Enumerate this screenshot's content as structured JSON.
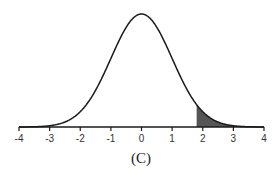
{
  "chart_data": {
    "type": "area",
    "title": "",
    "caption": "(C)",
    "xlabel": "",
    "ylabel": "",
    "xlim": [
      -4,
      4
    ],
    "x_ticks": [
      -4,
      -3,
      -2,
      -1,
      0,
      1,
      2,
      3,
      4
    ],
    "tick_labels": [
      "-4",
      "-3",
      "-2",
      "-1",
      "0",
      "1",
      "2",
      "3",
      "4"
    ],
    "curve": "standard normal density",
    "mean": 0,
    "sd": 1,
    "shaded_region": {
      "from": 1.8,
      "to": 4,
      "tail": "right"
    },
    "grid": false,
    "legend": "none",
    "colors": {
      "curve": "#1a1a1a",
      "shade": "#555555",
      "axis": "#1a1a1a"
    }
  }
}
